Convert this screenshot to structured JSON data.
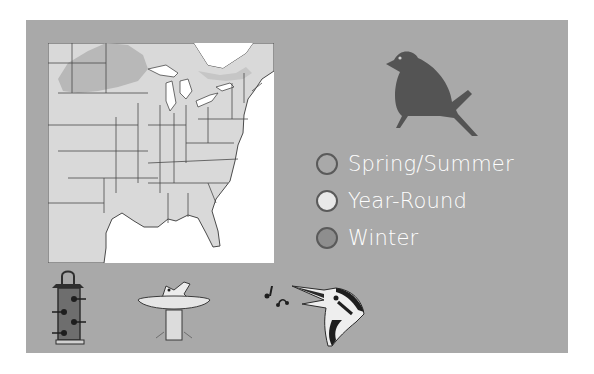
{
  "card": {
    "background": "#a9a9a9",
    "map": {
      "region": "Eastern United States",
      "land_color": "#d9d9d9",
      "water_color": "#ffffff",
      "range_shading_color": "#b4b4b4"
    },
    "bird_silhouette": {
      "icon": "perched-bird-icon",
      "color": "#545454"
    },
    "legend": {
      "items": [
        {
          "label": "Spring/Summer",
          "color": "#a9a9a9"
        },
        {
          "label": "Year-Round",
          "color": "#e8e8e8"
        },
        {
          "label": "Winter",
          "color": "#8e8e8e"
        }
      ]
    },
    "activity_icons": [
      {
        "name": "tube-feeder-icon"
      },
      {
        "name": "birdbath-icon"
      },
      {
        "name": "singing-bird-icon"
      }
    ]
  }
}
